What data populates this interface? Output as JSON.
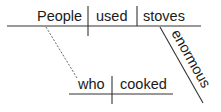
{
  "diagram": {
    "type": "sentence-diagram",
    "main_clause": {
      "subject": "People",
      "verb": "used",
      "direct_object": "stoves",
      "object_modifier": "enormous"
    },
    "relative_clause": {
      "subject": "who",
      "verb": "cooked",
      "connects_to": "People"
    }
  },
  "colors": {
    "lines": "#333333",
    "text": "#1a1a1a",
    "background": "#ffffff"
  }
}
